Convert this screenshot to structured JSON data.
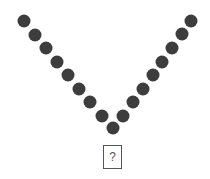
{
  "figure": {
    "type": "dot-pattern-puzzle",
    "shape": "V",
    "dot_color": "#3d3d3d",
    "dot_diameter": 13,
    "left_arm_dots": [
      [
        24,
        21
      ],
      [
        35,
        35
      ],
      [
        46,
        48
      ],
      [
        57,
        62
      ],
      [
        68,
        75
      ],
      [
        79,
        89
      ],
      [
        90,
        102
      ],
      [
        102,
        116
      ]
    ],
    "right_arm_dots": [
      [
        191,
        21
      ],
      [
        182,
        34
      ],
      [
        172,
        48
      ],
      [
        162,
        62
      ],
      [
        153,
        75
      ],
      [
        143,
        89
      ],
      [
        133,
        102
      ],
      [
        123,
        116
      ]
    ],
    "vertex_dot": [
      113,
      128
    ],
    "total_dots": 17
  },
  "answer_box": {
    "label": "?"
  }
}
